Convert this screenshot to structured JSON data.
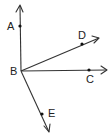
{
  "diagram": {
    "type": "geometry-rays",
    "vertex": {
      "label": "B",
      "x": 21,
      "y": 71,
      "label_x": 10,
      "label_y": 75
    },
    "rays": [
      {
        "id": "BA",
        "point_label": "A",
        "end_x": 20,
        "end_y": 6,
        "point_x": 20,
        "point_y": 26,
        "label_x": 7,
        "label_y": 30,
        "arrow": "M16,12 L20,5 L23,12"
      },
      {
        "id": "BD",
        "point_label": "D",
        "end_x": 99,
        "end_y": 38,
        "point_x": 82,
        "point_y": 44,
        "label_x": 78,
        "label_y": 39,
        "arrow": "M92,36 L99,38 L94,43"
      },
      {
        "id": "BC",
        "point_label": "C",
        "end_x": 107,
        "end_y": 70,
        "point_x": 89,
        "point_y": 70,
        "label_x": 86,
        "label_y": 83,
        "arrow": "M101,66 L107,70 L101,74"
      },
      {
        "id": "BE",
        "point_label": "E",
        "end_x": 49,
        "end_y": 132,
        "point_x": 42,
        "point_y": 114,
        "label_x": 48,
        "label_y": 117,
        "arrow": "M44,126 L49,132 L50,124"
      }
    ],
    "colors": {
      "line": "#333333",
      "point": "#111111",
      "text": "#222222"
    }
  }
}
